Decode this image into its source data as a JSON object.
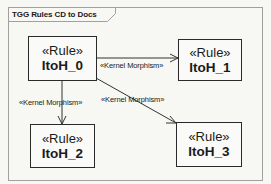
{
  "frame": {
    "title": "TGG Rules CD to Docs",
    "border_color": "#9a9a9a",
    "background": "#f7f7f4"
  },
  "rules": [
    {
      "id": "r0",
      "stereotype": "«Rule»",
      "name": "ItoH_0"
    },
    {
      "id": "r1",
      "stereotype": "«Rule»",
      "name": "ItoH_1"
    },
    {
      "id": "r2",
      "stereotype": "«Rule»",
      "name": "ItoH_2"
    },
    {
      "id": "r3",
      "stereotype": "«Rule»",
      "name": "ItoH_3"
    }
  ],
  "edges": [
    {
      "from": "ItoH_0",
      "to": "ItoH_1",
      "label": "«Kernel Morphism»"
    },
    {
      "from": "ItoH_0",
      "to": "ItoH_2",
      "label": "«Kernel Morphism»"
    },
    {
      "from": "ItoH_0",
      "to": "ItoH_3",
      "label": "«Kernel Morphism»"
    }
  ],
  "colors": {
    "text": "#1a1a1a",
    "box_border": "#2a2a2a",
    "edge": "#333333"
  }
}
